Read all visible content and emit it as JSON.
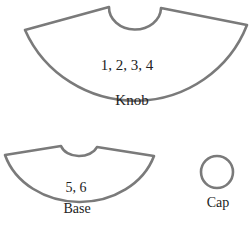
{
  "diagram": {
    "stroke_color": "#7a7a7a",
    "pieces": [
      {
        "id": "knob",
        "numbers": "1, 2, 3, 4",
        "label": "Knob"
      },
      {
        "id": "base",
        "numbers": "5, 6",
        "label": "Base"
      },
      {
        "id": "cap",
        "label": "Cap"
      }
    ]
  }
}
